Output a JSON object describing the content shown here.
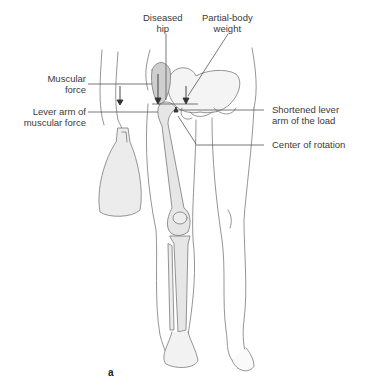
{
  "figure": {
    "panel_label": "a",
    "labels": {
      "diseased_hip": [
        "Diseased",
        "hip"
      ],
      "partial_body_weight": [
        "Partial-body",
        "weight"
      ],
      "muscular_force": [
        "Muscular",
        "force"
      ],
      "lever_arm_muscular": [
        "Lever arm of",
        "muscular force"
      ],
      "shortened_lever": [
        "Shortened lever",
        "arm of the load"
      ],
      "center_of_rotation": [
        "Center of rotation"
      ]
    },
    "colors": {
      "line": "#6a6a6a",
      "bone_fill": "#e6e6e6",
      "muscle_fill": "#cfcfcf",
      "text": "#3a3a3a"
    }
  }
}
